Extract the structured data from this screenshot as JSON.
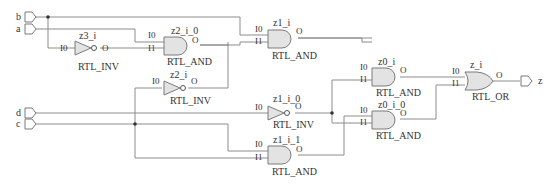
{
  "schematic": {
    "inputs": [
      {
        "name": "b",
        "label": "b"
      },
      {
        "name": "a",
        "label": "a"
      },
      {
        "name": "d",
        "label": "d"
      },
      {
        "name": "c",
        "label": "c"
      }
    ],
    "outputs": [
      {
        "name": "z",
        "label": "z"
      }
    ],
    "pins": {
      "i0": "I0",
      "i1": "I1",
      "o": "O"
    },
    "cells": [
      {
        "instance": "z3_i",
        "type": "RTL_INV"
      },
      {
        "instance": "z2_i_0",
        "type": "RTL_AND"
      },
      {
        "instance": "z2_i",
        "type": "RTL_INV"
      },
      {
        "instance": "z1_i",
        "type": "RTL_AND"
      },
      {
        "instance": "z1_i_0",
        "type": "RTL_INV"
      },
      {
        "instance": "z1_i_1",
        "type": "RTL_AND"
      },
      {
        "instance": "z0_i",
        "type": "RTL_AND"
      },
      {
        "instance": "z0_i_0",
        "type": "RTL_AND"
      },
      {
        "instance": "z_i",
        "type": "RTL_OR"
      }
    ],
    "colors": {
      "wire": "#8c8c8c",
      "gate_fill": "#e3e3e3",
      "gate_stroke": "#7a7a7a",
      "text": "#333333"
    }
  }
}
